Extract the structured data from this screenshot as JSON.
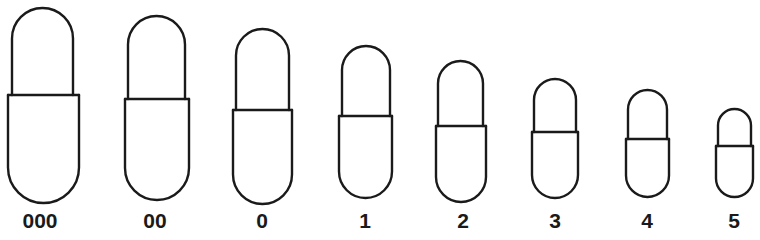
{
  "diagram": {
    "stroke_color": "#1a1a1a",
    "background": "#ffffff",
    "capsules": [
      {
        "label": "000",
        "label_x": 40,
        "cap": {
          "left": 12,
          "right": 73,
          "top": 8
        },
        "band_y": 95,
        "body": {
          "left": 8,
          "right": 79,
          "bottom": 203
        }
      },
      {
        "label": "00",
        "label_x": 155,
        "cap": {
          "left": 128,
          "right": 185,
          "top": 16
        },
        "band_y": 99,
        "body": {
          "left": 125,
          "right": 189,
          "bottom": 200
        }
      },
      {
        "label": "0",
        "label_x": 262,
        "cap": {
          "left": 236,
          "right": 289,
          "top": 29
        },
        "band_y": 110,
        "body": {
          "left": 233,
          "right": 292,
          "bottom": 204
        }
      },
      {
        "label": "1",
        "label_x": 365,
        "cap": {
          "left": 342,
          "right": 390,
          "top": 46
        },
        "band_y": 116,
        "body": {
          "left": 339,
          "right": 392,
          "bottom": 198
        }
      },
      {
        "label": "2",
        "label_x": 463,
        "cap": {
          "left": 438,
          "right": 483,
          "top": 61
        },
        "band_y": 126,
        "body": {
          "left": 436,
          "right": 486,
          "bottom": 202
        }
      },
      {
        "label": "3",
        "label_x": 555,
        "cap": {
          "left": 534,
          "right": 576,
          "top": 79
        },
        "band_y": 132,
        "body": {
          "left": 532,
          "right": 578,
          "bottom": 198
        }
      },
      {
        "label": "4",
        "label_x": 647,
        "cap": {
          "left": 628,
          "right": 667,
          "top": 90
        },
        "band_y": 139,
        "body": {
          "left": 626,
          "right": 669,
          "bottom": 197
        }
      },
      {
        "label": "5",
        "label_x": 734,
        "cap": {
          "left": 718,
          "right": 751,
          "top": 109
        },
        "band_y": 146,
        "body": {
          "left": 716,
          "right": 753,
          "bottom": 197
        }
      }
    ]
  }
}
